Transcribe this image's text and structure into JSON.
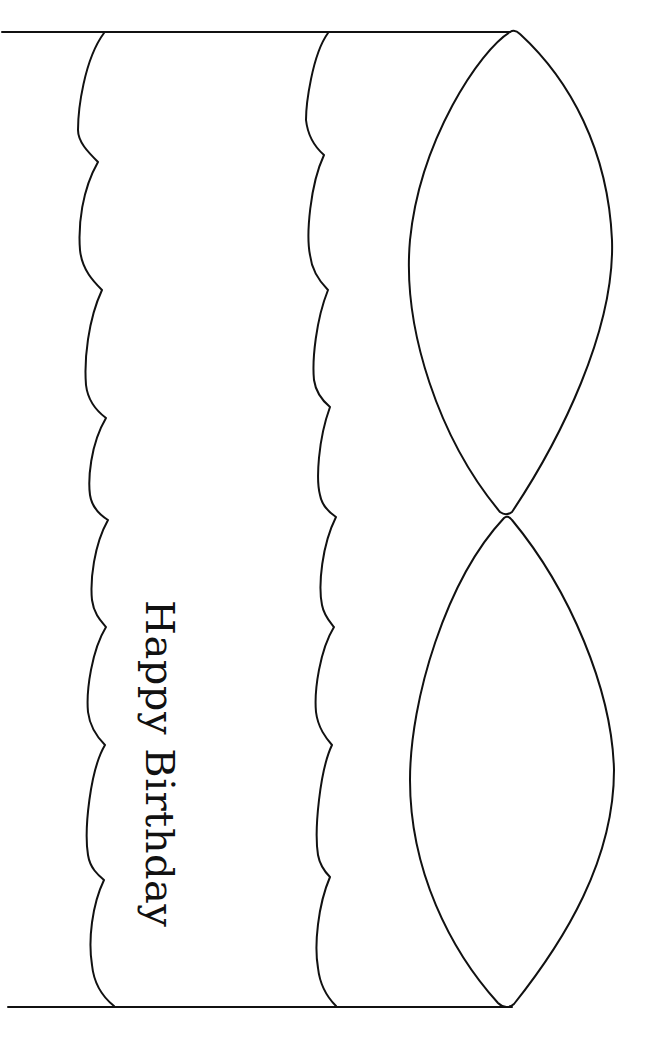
{
  "drawing": {
    "subject": "birthday cake outline (rotated 90°)",
    "caption": "Happy Birthday",
    "line_color": "#111111",
    "background": "#ffffff",
    "parts": [
      "base-line",
      "top-line",
      "frosting-scallop-1",
      "frosting-scallop-2",
      "cake-top-ellipse-upper",
      "cake-top-ellipse-lower"
    ]
  }
}
